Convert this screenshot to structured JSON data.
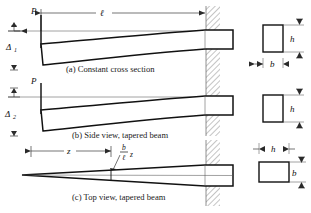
{
  "figure": {
    "background_color": "#ffffff",
    "line_color": "#111111",
    "wall_hatch_color": "#6b6b6b"
  },
  "panels": [
    {
      "id": "a",
      "caption": "(a) Constant cross section",
      "load_label": "P",
      "deflection_label": "Δ",
      "deflection_sub": "1",
      "length_label": "ℓ"
    },
    {
      "id": "b",
      "caption": "(b) Side view, tapered beam",
      "load_label": "P",
      "deflection_label": "Δ",
      "deflection_sub": "2"
    },
    {
      "id": "c",
      "caption": "(c) Top view, tapered beam",
      "distance_label": "z",
      "width_formula": {
        "numerator": "b",
        "denominator": "ℓ",
        "multiplier": "z"
      }
    }
  ],
  "cross_sections": [
    {
      "id": "a",
      "orientation": "tall",
      "height_label": "h",
      "width_label": "b"
    },
    {
      "id": "b",
      "orientation": "tall",
      "height_label": "h",
      "width_label": "b"
    },
    {
      "id": "c",
      "orientation": "wide",
      "height_label": "b",
      "width_label": "h"
    }
  ]
}
